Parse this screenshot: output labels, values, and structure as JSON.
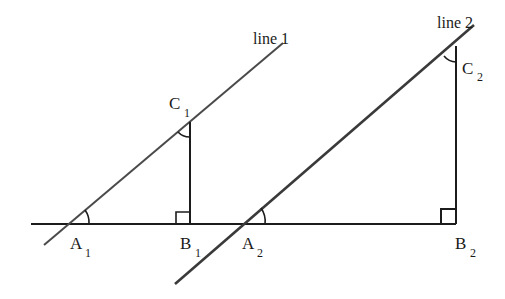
{
  "diagram": {
    "colors": {
      "black_line": "#1c1c1c",
      "slanted_line": "#4a4a4a",
      "background": "#ffffff"
    },
    "lines": {
      "line1": {
        "label": "line 1",
        "from": [
          44,
          245
        ],
        "to": [
          283,
          43
        ]
      },
      "line2": {
        "label": "line 2",
        "from": [
          175,
          284
        ],
        "to": [
          474,
          25
        ]
      }
    },
    "baseline": {
      "from": [
        31,
        224
      ],
      "to": [
        456,
        224
      ]
    },
    "points": {
      "A1": {
        "letter": "A",
        "sub": "1",
        "xy": [
          68,
          224
        ]
      },
      "B1": {
        "letter": "B",
        "sub": "1",
        "xy": [
          190,
          224
        ]
      },
      "C1": {
        "letter": "C",
        "sub": "1",
        "xy": [
          190,
          122
        ]
      },
      "A2": {
        "letter": "A",
        "sub": "2",
        "xy": [
          242,
          224
        ]
      },
      "B2": {
        "letter": "B",
        "sub": "2",
        "xy": [
          456,
          224
        ]
      },
      "C2": {
        "letter": "C",
        "sub": "2",
        "xy": [
          456,
          46
        ]
      }
    },
    "triangles": [
      {
        "name": "A1B1C1",
        "right_angle_at": "B1",
        "marked_angles": [
          "A1",
          "C1"
        ]
      },
      {
        "name": "A2B2C2",
        "right_angle_at": "B2",
        "marked_angles": [
          "A2",
          "C2"
        ]
      }
    ]
  }
}
